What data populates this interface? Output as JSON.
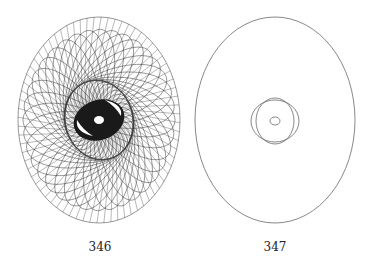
{
  "figures": [
    {
      "id": "fig-346",
      "caption": "346",
      "description": "Dense spirograph-like envelope of rotated ellipses with dark central eye",
      "outer_ellipse": {
        "cx": 99,
        "cy": 120,
        "rx": 81,
        "ry": 103
      },
      "curve_count": 36,
      "stroke_color": "#333333"
    },
    {
      "id": "fig-347",
      "caption": "347",
      "description": "Single large ellipse with two intersecting small ellipses and a tiny central ellipse",
      "outer_ellipse": {
        "cx": 275,
        "cy": 120,
        "rx": 80,
        "ry": 103
      },
      "inner_shapes": [
        {
          "cx": 275,
          "cy": 121,
          "rx": 24,
          "ry": 21
        },
        {
          "cx": 275,
          "cy": 121,
          "rx": 19,
          "ry": 23
        },
        {
          "cx": 275,
          "cy": 121,
          "rx": 5,
          "ry": 4
        }
      ],
      "stroke_color": "#555555"
    }
  ]
}
